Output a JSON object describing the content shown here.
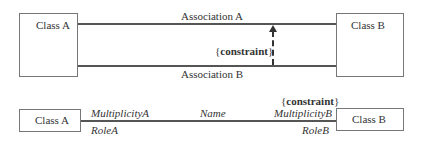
{
  "diagram": {
    "top": {
      "class_a": "Class A",
      "class_b": "Class B",
      "association_a": "Association A",
      "association_b": "Association B",
      "constraint_open": "{",
      "constraint": "constraint",
      "constraint_close": "}"
    },
    "bottom": {
      "class_a": "Class A",
      "class_b": "Class B",
      "multiplicity_a": "MultiplicityA",
      "role_a": "RoleA",
      "name": "Name",
      "multiplicity_b": "MultiplicityB",
      "role_b": "RoleB",
      "constraint_open": "{",
      "constraint": "constraint",
      "constraint_close": "}"
    },
    "colors": {
      "line": "#555555",
      "box_border": "#777777",
      "text": "#333333"
    }
  }
}
